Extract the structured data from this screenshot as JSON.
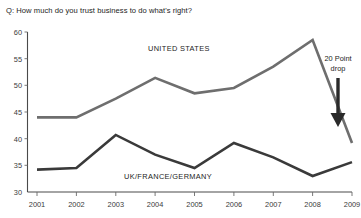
{
  "chart_data": {
    "type": "line",
    "title": "Q: How much do you trust business to do what's right?",
    "xlabel": "",
    "ylabel": "",
    "x": [
      "2001",
      "2002",
      "2003",
      "2004",
      "2005",
      "2006",
      "2007",
      "2008",
      "2009"
    ],
    "categories": [
      "2001",
      "2002",
      "2003",
      "2004",
      "2005",
      "2006",
      "2007",
      "2008",
      "2009"
    ],
    "ylim": [
      30,
      60
    ],
    "yticks": [
      "30",
      "35",
      "40",
      "45",
      "50",
      "55",
      "60"
    ],
    "grid": false,
    "legend_position": "inline-labels",
    "series": [
      {
        "name": "UNITED STATES",
        "color": "#6e6e6e",
        "values": [
          44,
          44,
          47.5,
          51.4,
          48.5,
          49.5,
          53.5,
          58.5,
          39.2
        ]
      },
      {
        "name": "UK/FRANCE/GERMANY",
        "color": "#3a3a3a",
        "values": [
          34.2,
          34.5,
          40.7,
          37,
          34.5,
          39.2,
          36.5,
          33,
          35.6
        ]
      }
    ],
    "annotations": [
      {
        "name": "twenty-point-drop",
        "line1": "20 Point",
        "line2": "drop",
        "arrow": "down"
      }
    ]
  },
  "series_labels": {
    "us": "UNITED STATES",
    "europe": "UK/FRANCE/GERMANY"
  }
}
